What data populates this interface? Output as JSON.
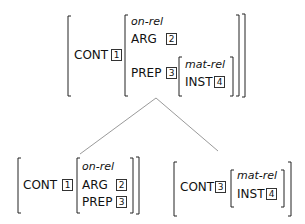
{
  "top": {
    "feature": "CONT",
    "tag": "1",
    "type": "on-rel",
    "arg": {
      "label": "ARG",
      "tag": "2"
    },
    "prep": {
      "label": "PREP",
      "tag": "3",
      "type": "mat-rel",
      "inst": {
        "label": "INST",
        "tag": "4"
      }
    }
  },
  "bottom_left": {
    "feature": "CONT",
    "tag": "1",
    "type": "on-rel",
    "arg": {
      "label": "ARG",
      "tag": "2"
    },
    "prep": {
      "label": "PREP",
      "tag": "3"
    }
  },
  "bottom_right": {
    "feature": "CONT",
    "tag": "3",
    "type": "mat-rel",
    "inst": {
      "label": "INST",
      "tag": "4"
    }
  }
}
